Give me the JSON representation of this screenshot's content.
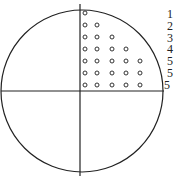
{
  "diagram": {
    "title": "",
    "row_labels": [
      "1",
      "2",
      "3",
      "4",
      "5",
      "5",
      "5"
    ],
    "row_dot_counts": [
      1,
      2,
      3,
      4,
      5,
      5,
      5
    ],
    "colors": {
      "stroke": "#222222",
      "background": "#ffffff"
    }
  }
}
